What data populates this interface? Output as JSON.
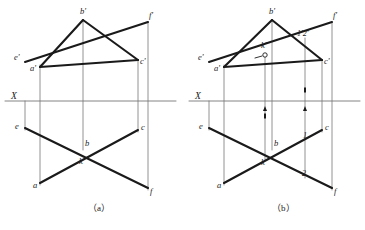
{
  "figure": {
    "background_color": "#ffffff",
    "ink_color": "#1a1a1a",
    "thin_color": "#767676",
    "panels": [
      {
        "id": "panel-a",
        "caption": "（a）",
        "caption_x": 88,
        "caption_y": 211,
        "ground_line": {
          "label": "X",
          "label_x": 11,
          "label_y": 99,
          "x1": 5,
          "x2": 176,
          "y": 101
        },
        "projectors": [
          {
            "name": "projector-e",
            "x": 25,
            "y1": 101,
            "y2": 130
          },
          {
            "name": "projector-a",
            "x": 40,
            "y1": 65,
            "y2": 185
          },
          {
            "name": "projector-b",
            "x": 83,
            "y1": 20,
            "y2": 150
          },
          {
            "name": "projector-c",
            "x": 138,
            "y1": 60,
            "y2": 132
          },
          {
            "name": "projector-f",
            "x": 148,
            "y1": 22,
            "y2": 190
          }
        ],
        "front_view": {
          "points": [
            {
              "name": "a-prime",
              "label": "a'",
              "x": 40,
              "y": 67,
              "lx": 30,
              "ly": 71
            },
            {
              "name": "b-prime",
              "label": "b'",
              "x": 83,
              "y": 20,
              "lx": 80,
              "ly": 14
            },
            {
              "name": "c-prime",
              "label": "c'",
              "x": 138,
              "y": 60,
              "lx": 140,
              "ly": 64
            },
            {
              "name": "e-prime",
              "label": "e'",
              "x": 25,
              "y": 62,
              "lx": 14,
              "ly": 60
            },
            {
              "name": "f-prime",
              "label": "f'",
              "x": 148,
              "y": 22,
              "lx": 149,
              "ly": 18
            }
          ],
          "segments": [
            {
              "name": "seg-ab-prime",
              "x1": 40,
              "y1": 67,
              "x2": 83,
              "y2": 20
            },
            {
              "name": "seg-bc-prime",
              "x1": 83,
              "y1": 20,
              "x2": 138,
              "y2": 60
            },
            {
              "name": "seg-ac-prime",
              "x1": 40,
              "y1": 67,
              "x2": 138,
              "y2": 60
            },
            {
              "name": "seg-ef-prime",
              "x1": 25,
              "y1": 62,
              "x2": 148,
              "y2": 22
            }
          ]
        },
        "top_view": {
          "points": [
            {
              "name": "a-point",
              "label": "a",
              "x": 40,
              "y": 183,
              "lx": 33,
              "ly": 188
            },
            {
              "name": "b-point",
              "label": "b",
              "x": 83,
              "y": 148,
              "lx": 85,
              "ly": 146
            },
            {
              "name": "c-point",
              "label": "c",
              "x": 138,
              "y": 130,
              "lx": 141,
              "ly": 130
            },
            {
              "name": "e-point",
              "label": "e",
              "x": 25,
              "y": 128,
              "lx": 15,
              "ly": 129
            },
            {
              "name": "f-point",
              "label": "f",
              "x": 148,
              "y": 188,
              "lx": 150,
              "ly": 194
            },
            {
              "name": "k-point",
              "label": "k",
              "x": 84,
              "y": 156,
              "lx": 79,
              "ly": 164
            }
          ],
          "segments": [
            {
              "name": "seg-ac",
              "x1": 40,
              "y1": 183,
              "x2": 138,
              "y2": 130
            },
            {
              "name": "seg-ef",
              "x1": 25,
              "y1": 128,
              "x2": 148,
              "y2": 188
            }
          ]
        }
      },
      {
        "id": "panel-b",
        "caption": "（b）",
        "caption_x": 272,
        "caption_y": 211,
        "ground_line": {
          "label": "X",
          "label_x": 195,
          "label_y": 99,
          "x1": 189,
          "x2": 360,
          "y": 101
        },
        "projectors": [
          {
            "name": "projector-e",
            "x": 209,
            "y1": 101,
            "y2": 130
          },
          {
            "name": "projector-a",
            "x": 224,
            "y1": 65,
            "y2": 185
          },
          {
            "name": "projector-k",
            "x": 265,
            "y1": 55,
            "y2": 160
          },
          {
            "name": "projector-b",
            "x": 272,
            "y1": 20,
            "y2": 150
          },
          {
            "name": "projector-12",
            "x": 305,
            "y1": 38,
            "y2": 178
          },
          {
            "name": "projector-c",
            "x": 322,
            "y1": 60,
            "y2": 132
          },
          {
            "name": "projector-f",
            "x": 332,
            "y1": 22,
            "y2": 190
          }
        ],
        "front_view": {
          "points": [
            {
              "name": "a-prime",
              "label": "a'",
              "x": 224,
              "y": 67,
              "lx": 214,
              "ly": 71
            },
            {
              "name": "b-prime",
              "label": "b'",
              "x": 272,
              "y": 20,
              "lx": 269,
              "ly": 14
            },
            {
              "name": "c-prime",
              "label": "c'",
              "x": 322,
              "y": 60,
              "lx": 324,
              "ly": 64
            },
            {
              "name": "e-prime",
              "label": "e'",
              "x": 209,
              "y": 62,
              "lx": 198,
              "ly": 60
            },
            {
              "name": "f-prime",
              "label": "f'",
              "x": 332,
              "y": 22,
              "lx": 333,
              "ly": 18
            },
            {
              "name": "k-prime",
              "label": "k'",
              "x": 265,
              "y": 55,
              "lx": 261,
              "ly": 48
            },
            {
              "name": "point-12-prime",
              "label": "1'2'",
              "x": 305,
              "y": 38,
              "lx": 297,
              "ly": 36
            }
          ],
          "segments": [
            {
              "name": "seg-ab-prime",
              "x1": 224,
              "y1": 67,
              "x2": 272,
              "y2": 20
            },
            {
              "name": "seg-bc-prime",
              "x1": 272,
              "y1": 20,
              "x2": 322,
              "y2": 60
            },
            {
              "name": "seg-ac-prime",
              "x1": 224,
              "y1": 67,
              "x2": 322,
              "y2": 60
            },
            {
              "name": "seg-ef-prime",
              "x1": 209,
              "y1": 62,
              "x2": 332,
              "y2": 22
            }
          ],
          "markers": [
            {
              "name": "k-prime-circle",
              "x": 265,
              "y": 55,
              "r": 2.2
            }
          ],
          "leaders": [
            {
              "name": "k-prime-leader",
              "x1": 255,
              "y1": 58,
              "x2": 262,
              "y2": 56
            }
          ]
        },
        "top_view": {
          "points": [
            {
              "name": "a-point",
              "label": "a",
              "x": 224,
              "y": 183,
              "lx": 217,
              "ly": 188
            },
            {
              "name": "b-point",
              "label": "b",
              "x": 272,
              "y": 148,
              "lx": 274,
              "ly": 146
            },
            {
              "name": "c-point",
              "label": "c",
              "x": 322,
              "y": 130,
              "lx": 325,
              "ly": 130
            },
            {
              "name": "e-point",
              "label": "e",
              "x": 209,
              "y": 128,
              "lx": 199,
              "ly": 129
            },
            {
              "name": "f-point",
              "label": "f",
              "x": 332,
              "y": 188,
              "lx": 334,
              "ly": 194
            },
            {
              "name": "k-point",
              "label": "k",
              "x": 266,
              "y": 157,
              "lx": 261,
              "ly": 165
            },
            {
              "name": "point-1",
              "label": "1",
              "x": 305,
              "y": 142,
              "lx": 303,
              "ly": 138
            },
            {
              "name": "point-2",
              "label": "2",
              "x": 305,
              "y": 170,
              "lx": 302,
              "ly": 176
            }
          ],
          "segments": [
            {
              "name": "seg-ac",
              "x1": 224,
              "y1": 183,
              "x2": 322,
              "y2": 130
            },
            {
              "name": "seg-ef",
              "x1": 209,
              "y1": 128,
              "x2": 332,
              "y2": 188
            }
          ]
        },
        "arrow_markers": [
          {
            "name": "arrow-up-k",
            "x": 265,
            "y": 101,
            "dir": "up"
          },
          {
            "name": "arrow-up-12",
            "x": 305,
            "y": 101,
            "dir": "up"
          }
        ],
        "dot_markers": [
          {
            "name": "dot-k-lower",
            "x": 265,
            "y": 116
          },
          {
            "name": "dot-12-upper",
            "x": 305,
            "y": 90
          }
        ]
      }
    ]
  }
}
